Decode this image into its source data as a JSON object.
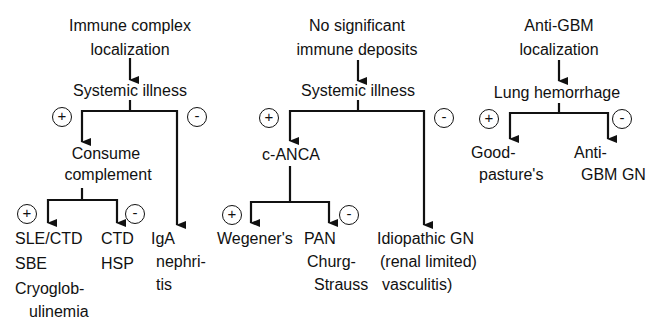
{
  "diagram": {
    "type": "flowchart",
    "branches": {
      "immune_complex": {
        "title_line1": "Immune complex",
        "title_line2": "localization",
        "question": "Systemic illness",
        "plus_label": "+",
        "minus_label": "-",
        "sub": {
          "title_line1": "Consume",
          "title_line2": "complement",
          "plus_label": "+",
          "minus_label": "-",
          "plus_outcomes": [
            "SLE/CTD",
            "SBE",
            "Cryoglob-",
            "ulinemia"
          ],
          "minus_outcomes": [
            "CTD",
            "HSP"
          ]
        },
        "minus_outcome": [
          "IgA",
          "nephri-",
          "tis"
        ]
      },
      "no_deposits": {
        "title_line1": "No significant",
        "title_line2": "immune deposits",
        "question": "Systemic illness",
        "plus_label": "+",
        "minus_label": "-",
        "sub": {
          "title": "c-ANCA",
          "plus_label": "+",
          "minus_label": "-",
          "plus_outcome": "Wegener's",
          "minus_outcomes": [
            "PAN",
            "Churg-",
            "Strauss"
          ]
        },
        "minus_outcome": [
          "Idiopathic GN",
          "(renal limited)",
          "vasculitis)"
        ]
      },
      "anti_gbm": {
        "title_line1": "Anti-GBM",
        "title_line2": "localization",
        "question": "Lung hemorrhage",
        "plus_label": "+",
        "minus_label": "-",
        "plus_outcome": [
          "Good-",
          "pasture's"
        ],
        "minus_outcome": [
          "Anti-",
          "GBM GN"
        ]
      }
    }
  }
}
